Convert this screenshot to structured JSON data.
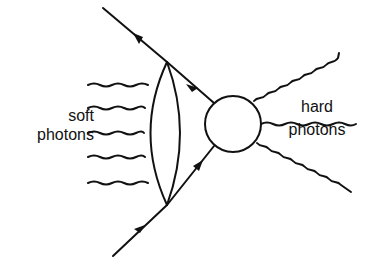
{
  "diagram": {
    "title": "",
    "labels": {
      "soft_line1": "soft",
      "soft_line2": "photons",
      "hard_line1": "hard",
      "hard_line2": "photons"
    },
    "colors": {
      "stroke": "#111111",
      "background": "#ffffff"
    },
    "elements": {
      "incoming_fermion": {
        "from": [
          113,
          256
        ],
        "to": [
          167,
          205
        ],
        "arrow": "toward-vertex"
      },
      "outgoing_fermion": {
        "from": [
          167,
          62
        ],
        "to": [
          103,
          8
        ],
        "arrow": "away-from-vertex"
      },
      "internal_fermion_upper": {
        "from": [
          167,
          62
        ],
        "to": [
          213,
          103
        ],
        "arrow": "toward-vertex"
      },
      "internal_fermion_lower": {
        "from": [
          167,
          205
        ],
        "to": [
          213,
          144
        ],
        "arrow": "toward-blob"
      },
      "blob": {
        "center": [
          233,
          124
        ],
        "radius": 28
      },
      "soft_photon_count": 5,
      "hard_photon_count": 3
    }
  }
}
